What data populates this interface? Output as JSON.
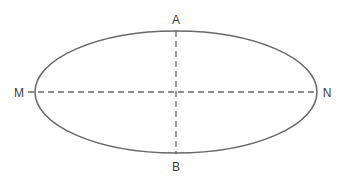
{
  "figure": {
    "kind": "geometry-diagram",
    "canvas": {
      "width": 344,
      "height": 181
    },
    "background_color": "#ffffff"
  },
  "shape": {
    "name": "ellipse",
    "center": {
      "x": 176,
      "y": 92
    },
    "semi_major_axis_x": 141,
    "semi_minor_axis_y": 61,
    "stroke_color": "#6a6a6a",
    "stroke_width": 1.6,
    "fill": "none"
  },
  "axes": {
    "major": {
      "name": "major-axis",
      "from_label": "M",
      "to_label": "N",
      "x1": 28,
      "y1": 92,
      "x2": 317,
      "y2": 92,
      "style": "dashed",
      "stroke_color": "#6a6a6a",
      "stroke_width": 1.3,
      "dash_pattern": "6 4"
    },
    "minor": {
      "name": "minor-axis",
      "from_label": "A",
      "to_label": "B",
      "x1": 176,
      "y1": 31,
      "x2": 176,
      "y2": 154,
      "style": "dashed",
      "stroke_color": "#6a6a6a",
      "stroke_width": 1.3,
      "dash_pattern": "6 4"
    }
  },
  "labels": [
    {
      "id": "label-a",
      "text": "A",
      "x": 176,
      "y": 24,
      "anchor": "middle",
      "color": "#3d3d3d",
      "font_size": 12
    },
    {
      "id": "label-b",
      "text": "B",
      "x": 176,
      "y": 171,
      "anchor": "middle",
      "color": "#3d3d3d",
      "font_size": 12
    },
    {
      "id": "label-m",
      "text": "M",
      "x": 19,
      "y": 97,
      "anchor": "middle",
      "color": "#3d3d3d",
      "font_size": 12
    },
    {
      "id": "label-n",
      "text": "N",
      "x": 327,
      "y": 97,
      "anchor": "middle",
      "color": "#3d3d3d",
      "font_size": 12
    }
  ]
}
